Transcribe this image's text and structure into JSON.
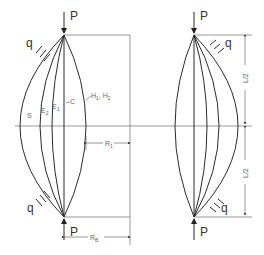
{
  "diagram": {
    "title": "",
    "left_figure": {
      "load_top": "P",
      "load_bottom": "P",
      "distributed_load_top": "q",
      "distributed_load_bottom": "q",
      "curve_labels": [
        "S",
        "E2",
        "E1",
        "C",
        "H1, H2"
      ],
      "curve_label_s": "S",
      "curve_label_e2": "E",
      "curve_label_e2_sub": "2",
      "curve_label_e1": "E",
      "curve_label_e1_sub": "1",
      "curve_label_c": "C",
      "curve_label_h": "H",
      "curve_label_h1_sub": "1",
      "curve_label_h_sep": ",",
      "curve_label_h2": "H",
      "curve_label_h2_sub": "2",
      "dimension_r1": "R",
      "dimension_r1_sub": "1",
      "dimension_rb": "R",
      "dimension_rb_sub": "B"
    },
    "right_figure": {
      "load_top": "P",
      "load_bottom": "P",
      "distributed_load_top": "q",
      "distributed_load_bottom": "q",
      "dimension_upper": "L/2",
      "dimension_lower": "L/2"
    },
    "colors": {
      "line": "#2a2a2a",
      "guide": "#888888",
      "background": "#ffffff"
    }
  }
}
